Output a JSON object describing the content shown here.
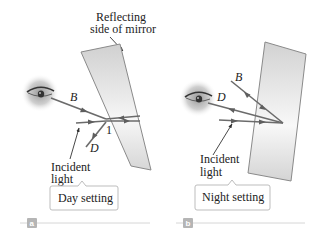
{
  "panels": [
    {
      "id": "a",
      "tag": "a",
      "setting_label": "Day setting",
      "mirror_label_line1": "Reflecting",
      "mirror_label_line2": "side of mirror",
      "ray_labels": {
        "B": "B",
        "D": "D",
        "point": "1"
      },
      "incident_line1": "Incident",
      "incident_line2": "light"
    },
    {
      "id": "b",
      "tag": "b",
      "setting_label": "Night setting",
      "ray_labels": {
        "B": "B",
        "D": "D"
      },
      "incident_line1": "Incident",
      "incident_line2": "light"
    }
  ],
  "colors": {
    "ray": "#6b6b6b",
    "mirror_edge": "#8a8a8a",
    "mirror_fill_light": "#f2f2f2",
    "mirror_fill_dark": "#c9c9c9",
    "callout_border": "#bdbdbd",
    "tag_fill": "#b5b5b5",
    "rule": "#d6d6d6"
  }
}
